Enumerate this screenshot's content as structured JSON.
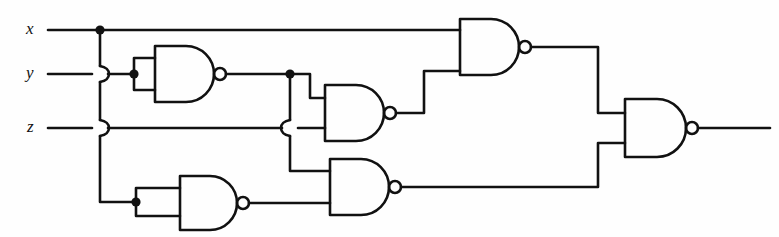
{
  "diagram": {
    "type": "logic-circuit-schematic",
    "background_color": "#fefefe",
    "line_color": "#111111",
    "line_width": 2.6
  },
  "inputs": [
    {
      "id": "x",
      "label": "x",
      "label_x": 30,
      "label_y": 30,
      "wire_y": 30
    },
    {
      "id": "y",
      "label": "y",
      "label_x": 30,
      "label_y": 74,
      "wire_y": 74
    },
    {
      "id": "z",
      "label": "z",
      "label_x": 30,
      "label_y": 128,
      "wire_y": 128
    }
  ],
  "outputs": [
    {
      "id": "f",
      "label": "",
      "wire_y": 128,
      "end_x": 770
    }
  ],
  "gates": [
    {
      "id": "g1",
      "kind": "NAND",
      "role": "inverter",
      "inputs": [
        "y",
        "y"
      ],
      "x": 155,
      "y": 74,
      "w": 80,
      "h": 56
    },
    {
      "id": "g2",
      "kind": "NAND",
      "role": "nand2",
      "inputs": [
        "g1",
        "z"
      ],
      "x": 325,
      "y": 113,
      "w": 76,
      "h": 56
    },
    {
      "id": "g3",
      "kind": "NAND",
      "role": "nand2",
      "inputs": [
        "x",
        "g2"
      ],
      "x": 460,
      "y": 47,
      "w": 76,
      "h": 56
    },
    {
      "id": "g4",
      "kind": "NAND",
      "role": "inverter",
      "inputs": [
        "x",
        "x"
      ],
      "x": 180,
      "y": 202,
      "w": 78,
      "h": 54
    },
    {
      "id": "g5",
      "kind": "NAND",
      "role": "nand2",
      "inputs": [
        "g1",
        "z"
      ],
      "x": 330,
      "y": 187,
      "w": 76,
      "h": 56
    },
    {
      "id": "g6",
      "kind": "NAND",
      "role": "nand2",
      "inputs": [
        "g3",
        "g5"
      ],
      "x": 625,
      "y": 128,
      "w": 76,
      "h": 58
    }
  ],
  "junction_dots": [
    {
      "id": "dot-x-bus",
      "x": 100,
      "y": 30
    },
    {
      "id": "dot-y-g1",
      "x": 134,
      "y": 74
    },
    {
      "id": "dot-g1-out",
      "x": 290,
      "y": 74
    },
    {
      "id": "dot-x-g4",
      "x": 136,
      "y": 202
    }
  ],
  "wire_hops": [
    {
      "id": "hop-xbus-over-y",
      "x": 100,
      "y": 74,
      "orientation": "vertical-over-horizontal"
    },
    {
      "id": "hop-xbus-over-z",
      "x": 100,
      "y": 128,
      "orientation": "vertical-over-horizontal"
    },
    {
      "id": "hop-g1branch-over-z",
      "x": 290,
      "y": 128,
      "orientation": "vertical-over-horizontal"
    }
  ],
  "legend": {
    "gate_symbol": "NAND (AND body + inversion bubble)",
    "bubble_radius": 6
  }
}
